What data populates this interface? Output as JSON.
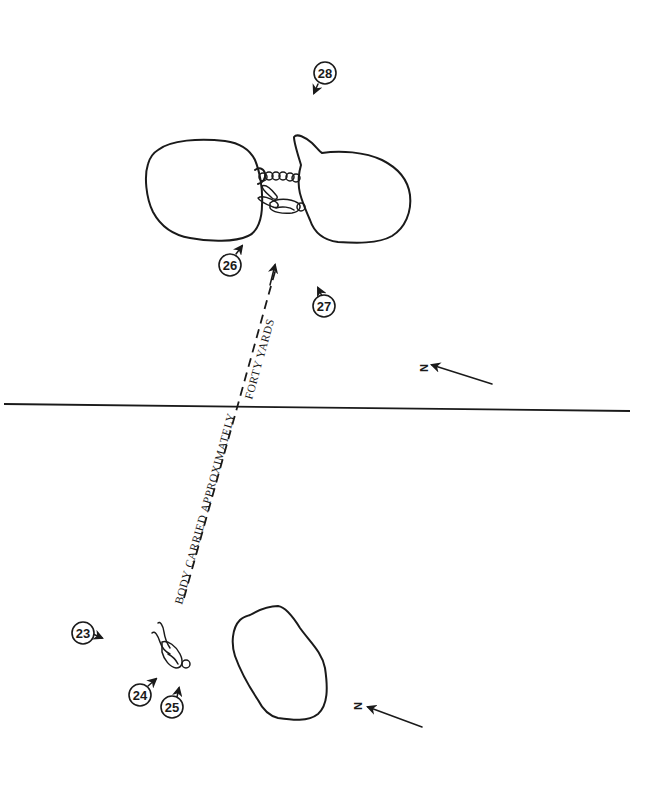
{
  "diagram": {
    "carry_label_part1": "BODY CARRIED APPROXIMATELY",
    "carry_label_part2": "FORTY YARDS",
    "north_label": "N",
    "markers": [
      {
        "id": "23",
        "label": "23"
      },
      {
        "id": "24",
        "label": "24"
      },
      {
        "id": "25",
        "label": "25"
      },
      {
        "id": "26",
        "label": "26"
      },
      {
        "id": "27",
        "label": "27"
      },
      {
        "id": "28",
        "label": "28"
      }
    ],
    "colors": {
      "ink": "#1a1a1a",
      "paper": "#ffffff"
    }
  }
}
